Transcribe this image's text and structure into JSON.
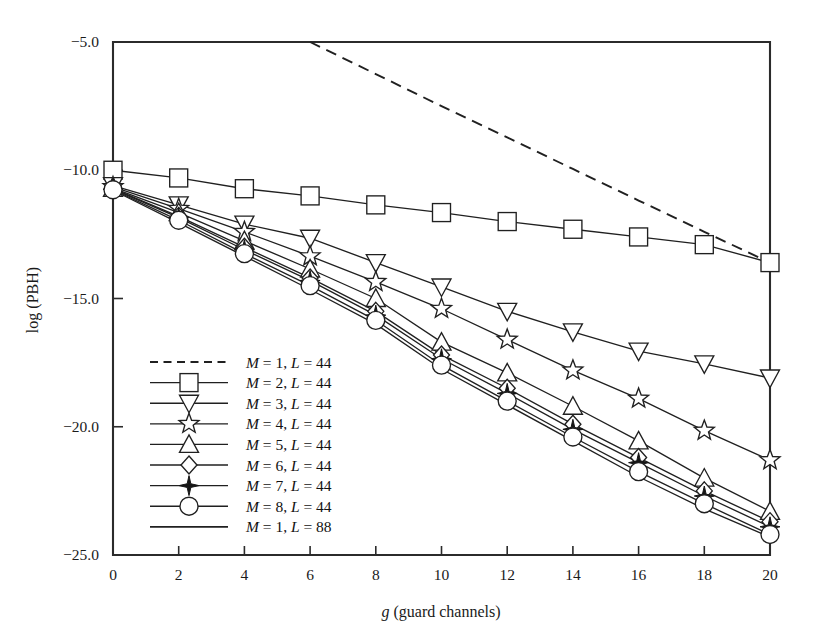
{
  "chart_data": {
    "type": "line",
    "title": "",
    "xlabel": "g (guard channels)",
    "ylabel": "log (PBH)",
    "xlim": [
      0,
      20
    ],
    "ylim": [
      -25.0,
      -5.0
    ],
    "xticks": [
      0,
      2,
      4,
      6,
      8,
      10,
      12,
      14,
      16,
      18,
      20
    ],
    "yticks": [
      -5.0,
      -10.0,
      -15.0,
      -20.0,
      -25.0
    ],
    "xticklabels": [
      "0",
      "2",
      "4",
      "6",
      "8",
      "10",
      "12",
      "14",
      "16",
      "18",
      "20"
    ],
    "yticklabels": [
      "-5.0",
      "-10.0",
      "-15.0",
      "-20.0",
      "-25.0"
    ],
    "grid": false,
    "legend_position": "lower-left-inside",
    "x": [
      0,
      2,
      4,
      6,
      8,
      10,
      12,
      14,
      16,
      18,
      20
    ],
    "series": [
      {
        "name": "M = 1, L = 44",
        "marker": "none",
        "linestyle": "dashed",
        "x": [
          6,
          8,
          10,
          12,
          14,
          16,
          18,
          20
        ],
        "values": [
          -5.0,
          -6.25,
          -7.5,
          -8.72,
          -9.95,
          -11.18,
          -12.4,
          -13.6
        ]
      },
      {
        "name": "M = 2, L = 44",
        "marker": "square",
        "linestyle": "solid",
        "values": [
          -10.0,
          -10.3,
          -10.72,
          -11.0,
          -11.35,
          -11.65,
          -12.0,
          -12.3,
          -12.6,
          -12.9,
          -13.6
        ]
      },
      {
        "name": "M = 3, L = 44",
        "marker": "triangle-down",
        "linestyle": "solid",
        "values": [
          -10.6,
          -11.35,
          -12.1,
          -12.65,
          -13.6,
          -14.55,
          -15.5,
          -16.3,
          -17.05,
          -17.55,
          -18.1
        ]
      },
      {
        "name": "M = 4, L = 44",
        "marker": "star",
        "linestyle": "solid",
        "values": [
          -10.65,
          -11.5,
          -12.4,
          -13.35,
          -14.35,
          -15.4,
          -16.6,
          -17.8,
          -18.9,
          -20.15,
          -21.3
        ]
      },
      {
        "name": "M = 5, L = 44",
        "marker": "triangle-up",
        "linestyle": "solid",
        "values": [
          -10.7,
          -11.65,
          -12.75,
          -13.85,
          -15.0,
          -16.7,
          -17.9,
          -19.2,
          -20.55,
          -22.0,
          -23.3
        ]
      },
      {
        "name": "M = 6, L = 44",
        "marker": "diamond",
        "linestyle": "solid",
        "values": [
          -10.72,
          -11.8,
          -13.0,
          -14.2,
          -15.5,
          -17.2,
          -18.5,
          -19.9,
          -21.2,
          -22.5,
          -23.7
        ]
      },
      {
        "name": "M = 7, L = 44",
        "marker": "star4-filled",
        "linestyle": "solid",
        "values": [
          -10.74,
          -11.85,
          -13.1,
          -14.3,
          -15.65,
          -17.35,
          -18.7,
          -20.1,
          -21.4,
          -22.7,
          -23.9
        ]
      },
      {
        "name": "M = 8, L = 44",
        "marker": "circle",
        "linestyle": "solid",
        "values": [
          -10.76,
          -11.95,
          -13.25,
          -14.5,
          -15.85,
          -17.6,
          -19.0,
          -20.4,
          -21.75,
          -23.0,
          -24.2
        ]
      },
      {
        "name": "M = 1, L = 88",
        "marker": "none",
        "linestyle": "solid",
        "values": [
          -10.78,
          -12.05,
          -13.35,
          -14.65,
          -16.0,
          -17.75,
          -19.15,
          -20.55,
          -21.95,
          -23.2,
          -24.3
        ]
      }
    ]
  },
  "figure": {
    "axis_color": "#2b2b2b",
    "series_color": "#202020",
    "background": "#ffffff"
  }
}
